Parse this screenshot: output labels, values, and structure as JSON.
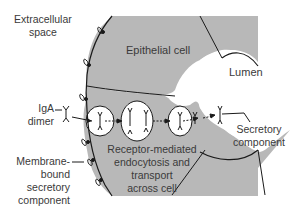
{
  "diagram": {
    "type": "biology-schematic",
    "colors": {
      "cell_fill": "#b8b8b8",
      "membrane_stroke": "#1a1a1a",
      "background": "#ffffff",
      "text": "#3a3a3a"
    },
    "labels": {
      "extracellular": [
        "Extracellular",
        "space"
      ],
      "epithelial_cell": "Epithelial cell",
      "lumen": "Lumen",
      "iga": [
        "IgA",
        "dimer"
      ],
      "membrane_bound": [
        "Membrane-",
        "bound",
        "secretory",
        "component"
      ],
      "transport": [
        "Receptor-mediated",
        "endocytosis and",
        "transport",
        "across cell"
      ],
      "secretory": [
        "Secretory",
        "component"
      ]
    }
  }
}
